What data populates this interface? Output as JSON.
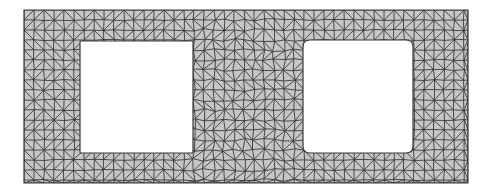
{
  "diagram": {
    "type": "triangular-mesh",
    "colors": {
      "background": "#ffffff",
      "fill": "#c6c6c6",
      "edge": "#3a3a3a"
    },
    "outer": {
      "x": 24,
      "y": 10,
      "width": 444,
      "height": 173
    },
    "holes": [
      {
        "name": "left-hole",
        "x": 80,
        "y": 41,
        "width": 113,
        "height": 112,
        "radius": 1
      },
      {
        "name": "right-hole",
        "x": 303,
        "y": 40,
        "width": 110,
        "height": 113,
        "radius": 7
      }
    ],
    "element_size": 10
  }
}
